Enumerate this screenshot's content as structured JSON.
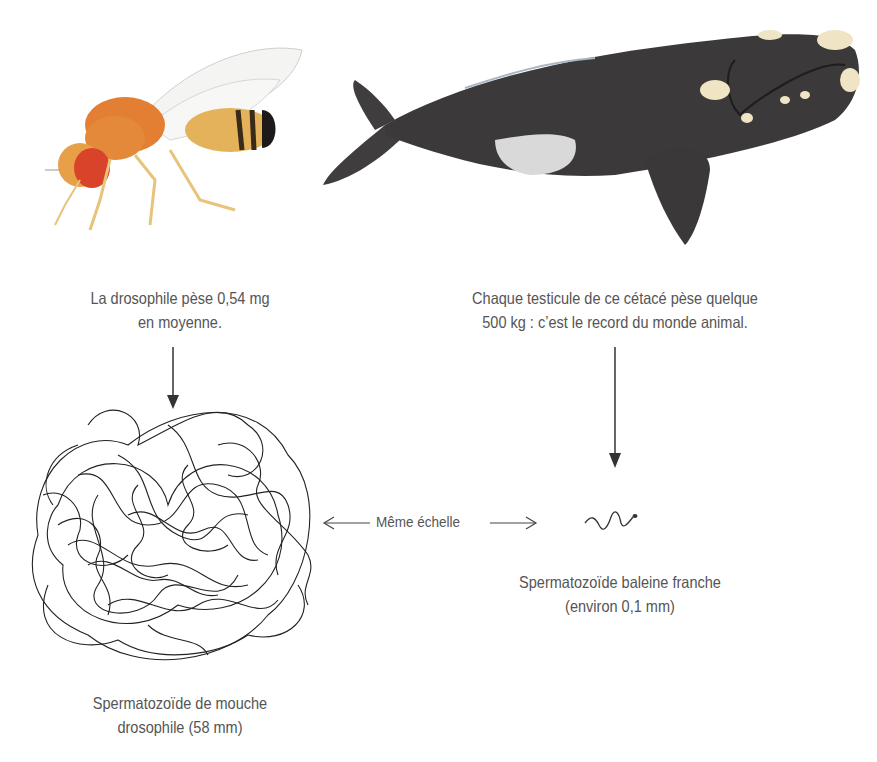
{
  "fly": {
    "illustration": "drosophila-fly",
    "caption_line1": "La drosophile pèse 0,54 mg",
    "caption_line2": "en moyenne."
  },
  "whale": {
    "illustration": "right-whale",
    "caption_line1": "Chaque testicule de ce cétacé pèse quelque",
    "caption_line2": "500 kg : c’est le record du monde animal."
  },
  "scale": {
    "label": "Même échelle",
    "left_arrow": "arrow-left",
    "right_arrow": "arrow-right"
  },
  "fly_sperm": {
    "illustration": "tangled-sperm",
    "caption_line1": "Spermatozoïde de mouche",
    "caption_line2": "drosophile (58 mm)"
  },
  "whale_sperm": {
    "illustration": "small-squiggle-sperm",
    "caption_line1": "Spermatozoïde baleine franche",
    "caption_line2": "(environ 0,1 mm)"
  },
  "colors": {
    "text": "#555555",
    "arrow": "#333333",
    "fly_body": "#e8853a",
    "fly_eye": "#d9432a",
    "whale_body": "#3a3838",
    "callosity": "#efe4c4"
  }
}
